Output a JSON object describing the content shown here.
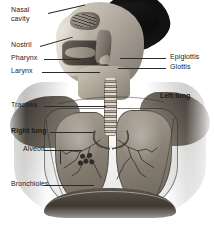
{
  "figure": {
    "style": "grayscale anatomical photograph with callout labels",
    "palette": {
      "background": "#ffffff",
      "text": "#1b1b1b",
      "leader_line": "#2a2a2a",
      "tissue_light": "#cfc6ba",
      "tissue_mid": "#8c8478",
      "tissue_dark": "#2e2a25",
      "hair_dark": "#111111"
    }
  },
  "labels": {
    "left": [
      {
        "id": "nasal-cavity",
        "text": "Nasal cavity",
        "line1": "Nasal",
        "line2": "cavity",
        "bold": false
      },
      {
        "id": "nostril",
        "text": "Nostril",
        "bold": false
      },
      {
        "id": "pharynx",
        "text": "Pharynx",
        "bold": false
      },
      {
        "id": "larynx",
        "text": "Larynx",
        "bold": false
      },
      {
        "id": "trachea",
        "text": "Trachea",
        "bold": false
      },
      {
        "id": "right-lung",
        "text": "Right lung",
        "bold": true
      },
      {
        "id": "alveoli",
        "text": "Alveoli",
        "bold": false
      },
      {
        "id": "bronchioles",
        "text": "Bronchioles",
        "bold": false
      }
    ],
    "right": [
      {
        "id": "epiglottis",
        "text": "Epiglottis",
        "bold": false
      },
      {
        "id": "glottis",
        "text": "Glottis",
        "bold": false
      },
      {
        "id": "left-lung",
        "text": "Left lung",
        "bold": true
      }
    ]
  },
  "structures": [
    "nasal cavity",
    "nostril",
    "pharynx",
    "larynx",
    "epiglottis",
    "glottis",
    "trachea",
    "right lung",
    "left lung",
    "bronchioles",
    "alveoli",
    "diaphragm"
  ]
}
